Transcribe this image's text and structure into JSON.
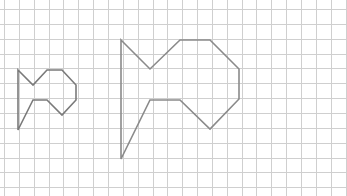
{
  "diagram": {
    "type": "grid-dilation",
    "width": 347,
    "height": 196,
    "grid": {
      "origin_x": 4,
      "origin_y": 9,
      "spacing": 14.85,
      "cols": 23,
      "rows": 12,
      "color": "#cfcfcf"
    },
    "shapes": [
      {
        "name": "small-shape",
        "stroke": "#7a7a7a",
        "points": [
          [
            18,
            70
          ],
          [
            33,
            85
          ],
          [
            47,
            70
          ],
          [
            62,
            70
          ],
          [
            76,
            85
          ],
          [
            76,
            100
          ],
          [
            62,
            115
          ],
          [
            47,
            100
          ],
          [
            33,
            100
          ],
          [
            18,
            130
          ]
        ]
      },
      {
        "name": "large-shape",
        "stroke": "#8a8a8a",
        "points": [
          [
            121,
            40
          ],
          [
            150,
            69
          ],
          [
            180,
            40
          ],
          [
            210,
            40
          ],
          [
            239,
            69
          ],
          [
            239,
            99
          ],
          [
            210,
            129
          ],
          [
            180,
            100
          ],
          [
            150,
            100
          ],
          [
            121,
            159
          ]
        ]
      }
    ]
  }
}
